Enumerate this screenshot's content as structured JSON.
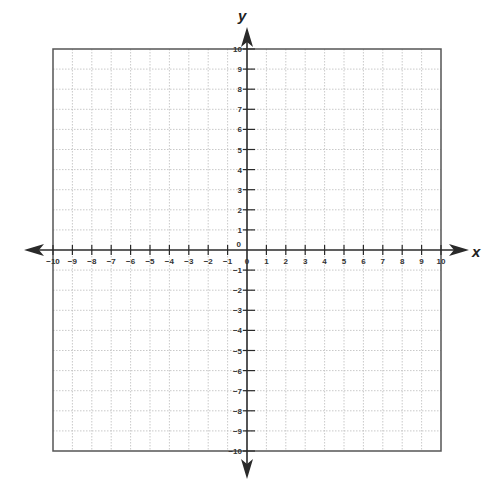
{
  "chart_data": {
    "type": "scatter",
    "title": "",
    "xlabel": "x",
    "ylabel": "y",
    "xlim": [
      -10,
      10
    ],
    "ylim": [
      -10,
      10
    ],
    "grid": true,
    "x_ticks": [
      -10,
      -9,
      -8,
      -7,
      -6,
      -5,
      -4,
      -3,
      -2,
      -1,
      0,
      1,
      2,
      3,
      4,
      5,
      6,
      7,
      8,
      9,
      10
    ],
    "y_ticks": [
      -10,
      -9,
      -8,
      -7,
      -6,
      -5,
      -4,
      -3,
      -2,
      -1,
      0,
      1,
      2,
      3,
      4,
      5,
      6,
      7,
      8,
      9,
      10
    ],
    "series": [],
    "legend": null
  },
  "colors": {
    "axis": "#2a2a2a",
    "border": "#555555",
    "grid": "#bbbbbb"
  }
}
